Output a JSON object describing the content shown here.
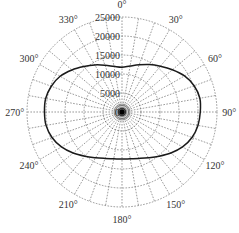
{
  "chart_data": {
    "type": "polar-line",
    "title": "",
    "angle_unit": "degrees",
    "angle_zero": "top",
    "angle_direction": "clockwise",
    "angle_ticks": [
      0,
      30,
      60,
      90,
      120,
      150,
      180,
      210,
      240,
      270,
      300,
      330
    ],
    "angle_tick_labels": [
      "0°",
      "30°",
      "60°",
      "90°",
      "120°",
      "150°",
      "180°",
      "210°",
      "240°",
      "270°",
      "300°",
      "330°"
    ],
    "radial_ticks": [
      0,
      5000,
      10000,
      15000,
      20000,
      25000
    ],
    "radial_tick_labels": [
      "0",
      "5000",
      "10000",
      "15000",
      "20000",
      "25000"
    ],
    "rlim": [
      0,
      25000
    ],
    "grid": true,
    "radial_gridline_step_deg": 10,
    "series": [
      {
        "name": "pattern",
        "theta": [
          0,
          10,
          20,
          30,
          40,
          50,
          60,
          70,
          80,
          90,
          100,
          110,
          120,
          130,
          140,
          150,
          160,
          170,
          180,
          190,
          200,
          210,
          220,
          230,
          240,
          250,
          260,
          270,
          280,
          290,
          300,
          310,
          320,
          330,
          340,
          350
        ],
        "r": [
          11800,
          12300,
          13200,
          14400,
          15700,
          17300,
          19000,
          20200,
          20800,
          20600,
          20300,
          19600,
          18400,
          16800,
          15200,
          13900,
          13000,
          12500,
          12400,
          12500,
          13000,
          13900,
          15200,
          16800,
          18400,
          19600,
          20300,
          20400,
          20400,
          19800,
          18800,
          17200,
          15600,
          14300,
          13100,
          12200
        ]
      }
    ]
  }
}
